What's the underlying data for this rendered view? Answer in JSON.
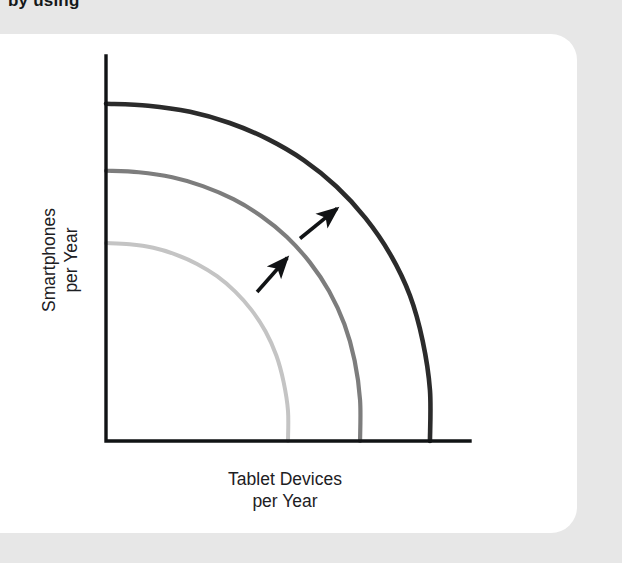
{
  "figure": {
    "title": "by using",
    "card_background": "#ffffff",
    "page_background": "#e7e7e7"
  },
  "chart_data": {
    "type": "line",
    "title": "",
    "xlabel": "Tablet Devices\nper Year",
    "ylabel": "Smartphones\nper Year",
    "axis_color": "#111315",
    "grid": false,
    "legend": false,
    "xlim": [
      0,
      100
    ],
    "ylim": [
      0,
      100
    ],
    "series": [
      {
        "name": "Original frontier",
        "color": "#c4c4c4",
        "width": 4.0,
        "x_intercept": 50.0,
        "y_intercept": 51.4,
        "points": [
          [
            0.0,
            51.4
          ],
          [
            6.5,
            51.1
          ],
          [
            13.0,
            50.2
          ],
          [
            19.0,
            48.5
          ],
          [
            25.0,
            46.0
          ],
          [
            30.5,
            42.8
          ],
          [
            35.5,
            38.8
          ],
          [
            40.0,
            34.0
          ],
          [
            43.8,
            28.5
          ],
          [
            46.8,
            22.2
          ],
          [
            48.8,
            15.3
          ],
          [
            50.0,
            7.8
          ],
          [
            50.0,
            0.0
          ]
        ]
      },
      {
        "name": "First outward shift",
        "color": "#7d7d7d",
        "width": 4.2,
        "x_intercept": 69.8,
        "y_intercept": 70.2,
        "points": [
          [
            0.0,
            70.2
          ],
          [
            9.0,
            69.8
          ],
          [
            18.2,
            68.5
          ],
          [
            26.6,
            66.2
          ],
          [
            35.0,
            62.8
          ],
          [
            42.7,
            58.4
          ],
          [
            49.7,
            53.0
          ],
          [
            56.0,
            46.4
          ],
          [
            61.3,
            38.9
          ],
          [
            65.5,
            30.3
          ],
          [
            68.3,
            20.9
          ],
          [
            69.8,
            10.6
          ],
          [
            69.8,
            0.0
          ]
        ]
      },
      {
        "name": "Second outward shift",
        "color": "#2b2b2b",
        "width": 4.6,
        "x_intercept": 89.0,
        "y_intercept": 87.6,
        "points": [
          [
            0.0,
            87.6
          ],
          [
            11.6,
            87.1
          ],
          [
            23.1,
            85.5
          ],
          [
            34.0,
            82.6
          ],
          [
            44.5,
            78.4
          ],
          [
            54.4,
            72.9
          ],
          [
            63.3,
            66.1
          ],
          [
            71.3,
            57.9
          ],
          [
            78.1,
            48.5
          ],
          [
            83.5,
            37.8
          ],
          [
            87.0,
            26.0
          ],
          [
            89.0,
            13.2
          ],
          [
            89.0,
            0.0
          ]
        ]
      }
    ],
    "annotations": [
      {
        "name": "growth-arrow-lower",
        "type": "arrow",
        "color": "#111315",
        "from": [
          41.5,
          38.7
        ],
        "to": [
          49.8,
          47.6
        ]
      },
      {
        "name": "growth-arrow-upper",
        "type": "arrow",
        "color": "#111315",
        "from": [
          53.3,
          52.6
        ],
        "to": [
          63.5,
          60.4
        ]
      }
    ]
  }
}
